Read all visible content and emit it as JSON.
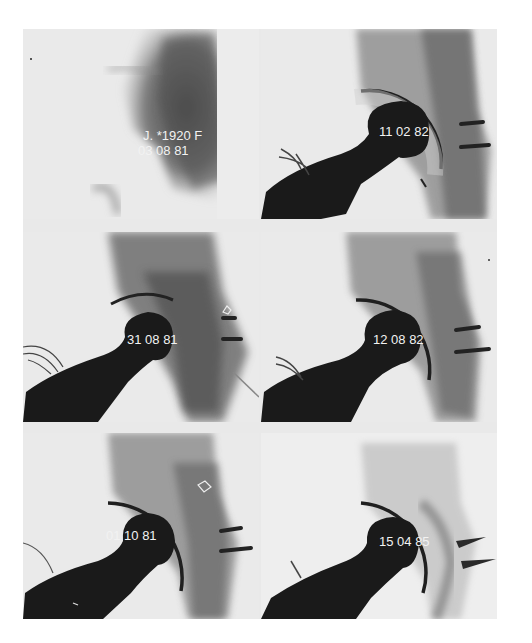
{
  "figure": {
    "patient_label": "J. *1920 F",
    "panels": [
      {
        "position": "top-left",
        "date": "03 08 81",
        "type": "preoperative"
      },
      {
        "position": "top-right",
        "date": "11 02 82",
        "type": "postoperative"
      },
      {
        "position": "middle-left",
        "date": "31 08 81",
        "type": "postoperative"
      },
      {
        "position": "middle-right",
        "date": "12 08 82",
        "type": "postoperative"
      },
      {
        "position": "bottom-left",
        "date": "01 10 81",
        "type": "postoperative"
      },
      {
        "position": "bottom-right",
        "date": "15 04 85",
        "type": "postoperative"
      }
    ]
  },
  "colors": {
    "background": "#ffffff",
    "film_light": "#ececec",
    "bone_shadow": "#6a6a6a",
    "prosthesis": "#1a1a1a",
    "label_text": "#f2f2f2"
  }
}
